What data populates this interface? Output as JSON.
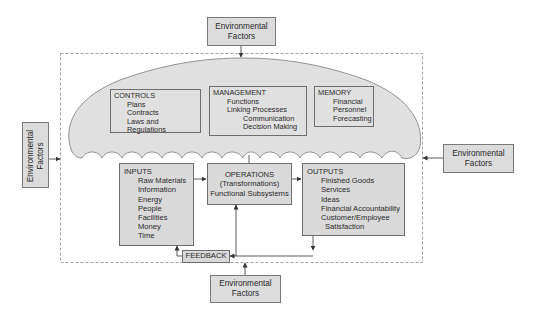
{
  "environment": {
    "top": {
      "line1": "Environmental",
      "line2": "Factors"
    },
    "left": {
      "line1": "Environmental",
      "line2": "Factors"
    },
    "right": {
      "line1": "Environmental",
      "line2": "Factors"
    },
    "bottom": {
      "line1": "Environmental",
      "line2": "Factors"
    }
  },
  "controls": {
    "title": "CONTROLS",
    "items": [
      "Plans",
      "Contracts",
      "Laws and Regulations"
    ]
  },
  "management": {
    "title": "MANAGEMENT",
    "items": [
      "Functions",
      "Linking Processes"
    ],
    "subitems": [
      "Communication",
      "Decision Making"
    ]
  },
  "memory": {
    "title": "MEMORY",
    "items": [
      "Financial",
      "Personnel",
      "Forecasting"
    ]
  },
  "inputs": {
    "title": "INPUTS",
    "items": [
      "Raw Materials",
      "Information",
      "Energy",
      "People",
      "Facilities",
      "Money",
      "Time"
    ]
  },
  "operations": {
    "line1": "OPERATIONS",
    "line2": "(Transformations)",
    "line3": "Functional Subsystems"
  },
  "outputs": {
    "title": "OUTPUTS",
    "items": [
      "Finished Goods",
      "Services",
      "Ideas",
      "Financial Accountability",
      "Customer/Employee"
    ],
    "continuation": "Satisfaction"
  },
  "feedback": {
    "label": "FEEDBACK"
  },
  "colors": {
    "box_fill": "#dcdcdc",
    "cloud_fill": "#e0e0e0",
    "stroke": "#6e6e6e",
    "dashed": "#8a8a8a"
  }
}
